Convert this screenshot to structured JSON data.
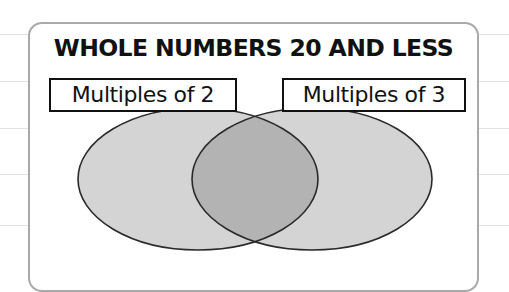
{
  "diagram": {
    "type": "venn",
    "title": "WHOLE NUMBERS 20 AND LESS",
    "sets": [
      {
        "id": "left",
        "label": "Multiples of 2",
        "fill": "#d4d4d4"
      },
      {
        "id": "right",
        "label": "Multiples of 3",
        "fill": "#d4d4d4"
      }
    ],
    "intersection": {
      "fill": "#b3b3b3"
    },
    "colors": {
      "outline": "#2a2a2a",
      "panel_border": "#a9a9a9",
      "label_border": "#111111",
      "text": "#111111"
    }
  }
}
